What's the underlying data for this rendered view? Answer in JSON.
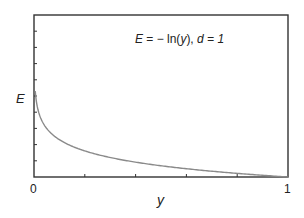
{
  "chart_data": {
    "type": "line",
    "title": "",
    "annotation": "E = −ln(y),  d = 1",
    "xlabel": "y",
    "ylabel": "E",
    "xlim": [
      0,
      1
    ],
    "ylim": [
      0,
      10
    ],
    "x_ticks": [
      0,
      0.2,
      0.4,
      0.6,
      0.8,
      1
    ],
    "x_tick_labels": [
      "0",
      "",
      "",
      "",
      "",
      "1"
    ],
    "y_ticks": [
      0,
      1,
      2,
      3,
      4,
      5,
      6,
      7,
      8,
      9,
      10
    ],
    "y_tick_labels": [],
    "grid": false,
    "legend": null,
    "series": [
      {
        "name": "E = -ln(y)",
        "color": "#8a8a8a",
        "x": [
          0.005,
          0.01,
          0.02,
          0.03,
          0.05,
          0.075,
          0.1,
          0.15,
          0.2,
          0.3,
          0.4,
          0.5,
          0.6,
          0.7,
          0.8,
          0.9,
          1.0
        ],
        "values": [
          5.3,
          4.61,
          3.91,
          3.51,
          3.0,
          2.59,
          2.3,
          1.9,
          1.61,
          1.2,
          0.92,
          0.69,
          0.51,
          0.36,
          0.22,
          0.11,
          0.0
        ]
      }
    ]
  },
  "labels": {
    "annotation_E": "E",
    "annotation_eq": " = − ln(",
    "annotation_y": "y",
    "annotation_close": "),  ",
    "annotation_d": "d",
    "annotation_val": " = 1",
    "xlabel": "y",
    "ylabel": "E",
    "xtick_0": "0",
    "xtick_1": "1"
  },
  "colors": {
    "axis": "#333333",
    "curve": "#8a8a8a"
  }
}
